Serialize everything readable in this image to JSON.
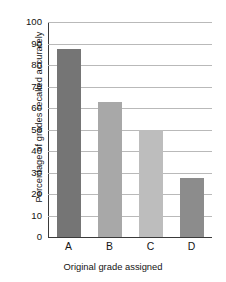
{
  "chart_data": {
    "type": "bar",
    "title": "",
    "categories": [
      "A",
      "B",
      "C",
      "D"
    ],
    "values": [
      87.5,
      63,
      50,
      27.5
    ],
    "xlabel": "Original grade assigned",
    "ylabel": "Percentage of grades recalled accurately",
    "ylim": [
      0,
      100
    ],
    "ytick_values": [
      0,
      10,
      20,
      30,
      40,
      50,
      60,
      70,
      80,
      90,
      100
    ],
    "ytick_labels": [
      "0",
      "10",
      "20",
      "30",
      "40",
      "50",
      "60",
      "70",
      "80",
      "90",
      "100"
    ],
    "bar_colors": [
      "#757575",
      "#a8a8a8",
      "#bdbdbd",
      "#8c8c8c"
    ],
    "grid": true,
    "grid_axis": "y",
    "legend": false,
    "legend_position": "none"
  }
}
